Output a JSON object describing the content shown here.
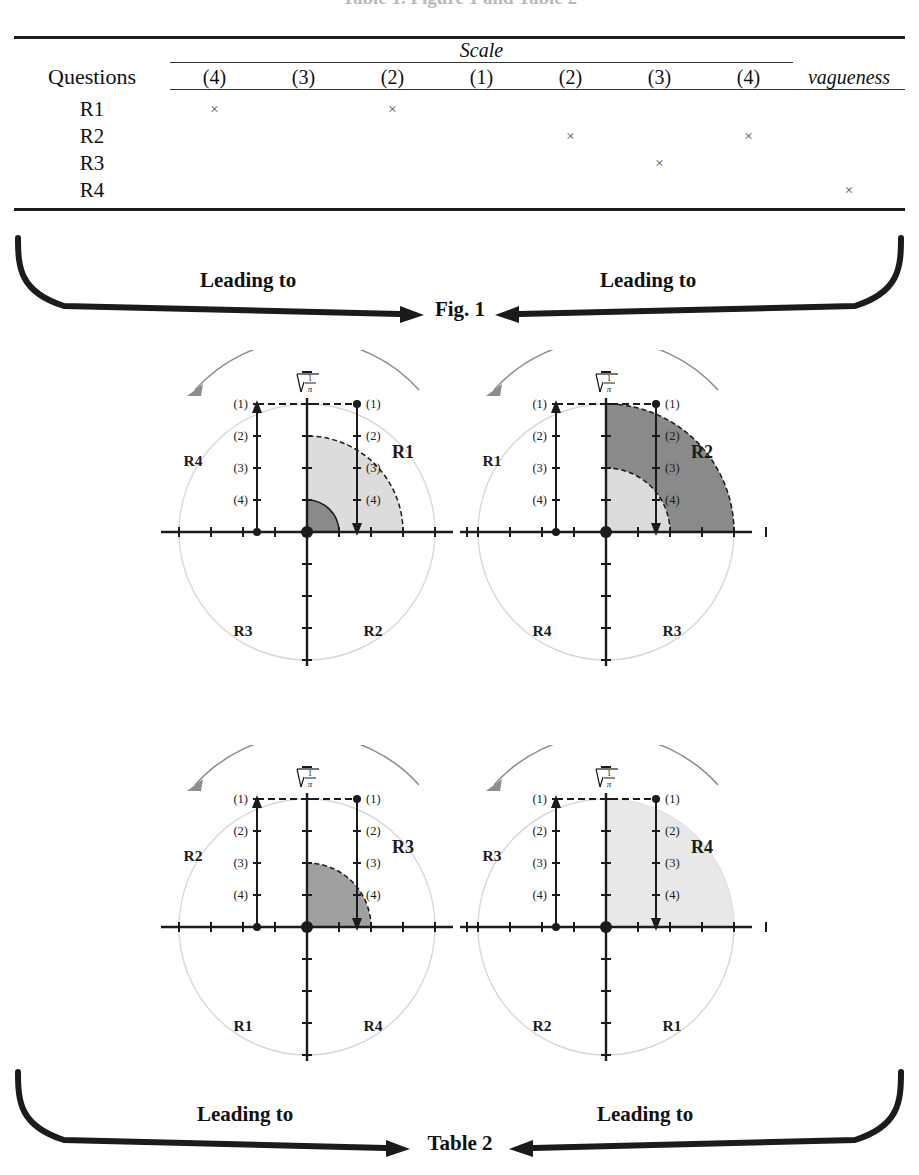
{
  "page": {
    "cutoff_title": "Table 1. Figure 1 and Table 2"
  },
  "table1": {
    "questions_header": "Questions",
    "scale_header": "Scale",
    "vagueness_header": "vagueness",
    "columns": [
      "(4)",
      "(3)",
      "(2)",
      "(1)",
      "(2)",
      "(3)",
      "(4)"
    ],
    "mark": "×",
    "rows": [
      {
        "label": "R1",
        "marks": [
          true,
          false,
          true,
          false,
          false,
          false,
          false
        ],
        "vagueness": false
      },
      {
        "label": "R2",
        "marks": [
          false,
          false,
          false,
          false,
          true,
          false,
          true
        ],
        "vagueness": false
      },
      {
        "label": "R3",
        "marks": [
          false,
          false,
          false,
          false,
          false,
          true,
          false
        ],
        "vagueness": false
      },
      {
        "label": "R4",
        "marks": [
          false,
          false,
          false,
          false,
          false,
          false,
          false
        ],
        "vagueness": true
      }
    ]
  },
  "connector_top": {
    "left_label": "Leading to",
    "right_label": "Leading to",
    "target": "Fig. 1"
  },
  "connector_bottom": {
    "left_label": "Leading to",
    "right_label": "Leading to",
    "target": "Table 2"
  },
  "figure": {
    "radicand_label": "√(1/π)",
    "radical_numerator": "1",
    "radical_denominator": "π",
    "level_labels": [
      "(1)",
      "(2)",
      "(3)",
      "(4)"
    ],
    "diagrams": [
      {
        "name": "R1",
        "main_label": "R1",
        "quadrant_labels": {
          "q1": "R1",
          "q2": "R4",
          "q3": "R3",
          "q4": "R2"
        },
        "shaded": [
          {
            "tone": "light",
            "level": 2,
            "outline": "dashed"
          },
          {
            "tone": "dark",
            "level": 4,
            "outline": "solid"
          }
        ]
      },
      {
        "name": "R2",
        "main_label": "R2",
        "quadrant_labels": {
          "q1": "R2",
          "q2": "R1",
          "q3": "R4",
          "q4": "R3"
        },
        "shaded": [
          {
            "tone": "dark",
            "level": 0,
            "outline": "dashed"
          },
          {
            "tone": "light",
            "level": 3,
            "outline": "dashed"
          }
        ]
      },
      {
        "name": "R3",
        "main_label": "R3",
        "quadrant_labels": {
          "q1": "R3",
          "q2": "R2",
          "q3": "R1",
          "q4": "R4"
        },
        "shaded": [
          {
            "tone": "medium",
            "level": 3,
            "outline": "dashed"
          }
        ]
      },
      {
        "name": "R4",
        "main_label": "R4",
        "quadrant_labels": {
          "q1": "R4",
          "q2": "R3",
          "q3": "R2",
          "q4": "R1"
        },
        "shaded": [
          {
            "tone": "verylight",
            "level": 0,
            "outline": "none"
          }
        ]
      }
    ],
    "colors": {
      "dark": "#8a8a8a",
      "medium": "#a0a0a0",
      "light": "#dcdcdc",
      "verylight": "#e8e8e8",
      "circle_outline": "#d8d8d8",
      "axis": "#1b1b1b"
    }
  }
}
